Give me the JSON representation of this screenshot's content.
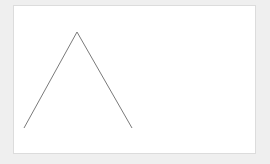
{
  "canvas": {
    "background": "#efefef",
    "panel_background": "#ffffff",
    "panel_border": "#dcdcdc"
  },
  "shape": {
    "type": "polyline",
    "stroke": "#7a7a7a",
    "stroke_width": 1,
    "points": [
      [
        24,
        128
      ],
      [
        77,
        32
      ],
      [
        132,
        128
      ]
    ],
    "points_attr": "24,128 77,32 132,128"
  }
}
